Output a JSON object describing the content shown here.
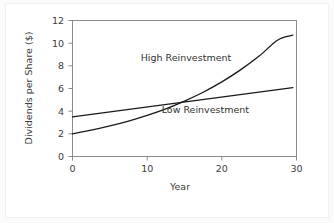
{
  "chart_data": {
    "type": "line",
    "title": "",
    "subtitle": "",
    "xlabel": "Year",
    "ylabel": "Dividends per Share ($)",
    "xlim": [
      0,
      30
    ],
    "ylim": [
      0,
      12
    ],
    "xticks": [
      "0",
      "10",
      "20",
      "30"
    ],
    "xtick_values": [
      0,
      10,
      20,
      30
    ],
    "yticks": [
      "0",
      "2",
      "4",
      "6",
      "8",
      "10",
      "12"
    ],
    "ytick_values": [
      0,
      2,
      4,
      6,
      8,
      10,
      12
    ],
    "grid": false,
    "legend_position": "inline-annotations",
    "x": [
      0,
      2.5,
      5,
      7.5,
      10,
      12.5,
      15,
      17.5,
      20,
      22.5,
      25,
      27.5,
      29.5
    ],
    "series": [
      {
        "name": "High Reinvestment",
        "shape": "exponential",
        "values": [
          2.0,
          2.32,
          2.7,
          3.13,
          3.63,
          4.21,
          4.89,
          5.67,
          6.58,
          7.64,
          8.86,
          10.28,
          10.7
        ],
        "color": "#1a1a1a",
        "label_x": 15.2,
        "label_y": 8.45
      },
      {
        "name": "Low Reinvestment",
        "shape": "linear",
        "values": [
          3.5,
          3.72,
          3.94,
          4.16,
          4.38,
          4.6,
          4.82,
          5.04,
          5.26,
          5.48,
          5.7,
          5.92,
          6.08
        ],
        "color": "#1a1a1a",
        "label_x": 17.8,
        "label_y": 3.8
      }
    ],
    "crossover": {
      "x": 13.5,
      "y": 4.6
    }
  },
  "annotations": {
    "high_label": "High Reinvestment",
    "low_label": "Low Reinvestment"
  },
  "axes": {
    "x_title": "Year",
    "y_title": "Dividends per Share ($)"
  }
}
